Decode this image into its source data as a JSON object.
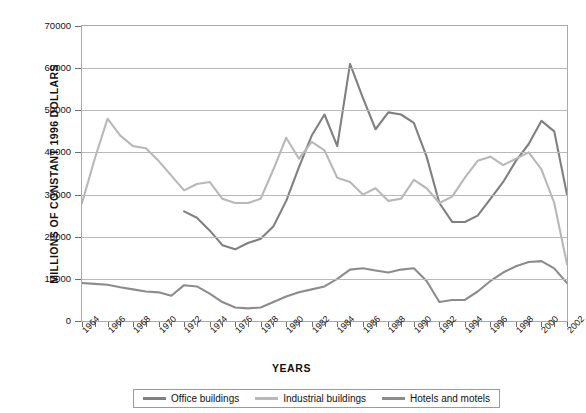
{
  "chart_data": {
    "type": "line",
    "title": "",
    "xlabel": "YEARS",
    "ylabel": "MILLIONS OF CONSTANT 1996 DOLLARS",
    "xlim": [
      1964,
      2002
    ],
    "ylim": [
      0,
      70000
    ],
    "grid": true,
    "legend_position": "bottom",
    "x_tick_labels": [
      "1964",
      "1966",
      "1968",
      "1970",
      "1972",
      "1974",
      "1976",
      "1978",
      "1980",
      "1982",
      "1984",
      "1986",
      "1988",
      "1990",
      "1992",
      "1994",
      "1996",
      "1998",
      "2000",
      "2002"
    ],
    "y_tick_labels": [
      "0",
      "10000",
      "20000",
      "30000",
      "40000",
      "50000",
      "60000",
      "70000"
    ],
    "y_ticks": [
      0,
      10000,
      20000,
      30000,
      40000,
      50000,
      60000,
      70000
    ],
    "x": [
      1964,
      1965,
      1966,
      1967,
      1968,
      1969,
      1970,
      1971,
      1972,
      1973,
      1974,
      1975,
      1976,
      1977,
      1978,
      1979,
      1980,
      1981,
      1982,
      1983,
      1984,
      1985,
      1986,
      1987,
      1988,
      1989,
      1990,
      1991,
      1992,
      1993,
      1994,
      1995,
      1996,
      1997,
      1998,
      1999,
      2000,
      2001,
      2002
    ],
    "series": [
      {
        "name": "Office buildings",
        "color": "#808080",
        "values": [
          null,
          null,
          null,
          null,
          null,
          null,
          null,
          null,
          26000,
          24500,
          21500,
          18000,
          17000,
          18500,
          19500,
          22500,
          28500,
          36500,
          44000,
          49000,
          41500,
          61000,
          53000,
          45500,
          49500,
          49000,
          47000,
          39000,
          28000,
          23500,
          23500,
          25000,
          29000,
          33000,
          38000,
          42000,
          47500,
          45000,
          30000
        ]
      },
      {
        "name": "Industrial buildings",
        "color": "#b8b8b8",
        "values": [
          28000,
          38500,
          48000,
          44000,
          41500,
          41000,
          38000,
          34500,
          31000,
          32500,
          33000,
          29000,
          28000,
          28000,
          29000,
          36000,
          43500,
          38500,
          42500,
          40500,
          34000,
          33000,
          30000,
          31500,
          28500,
          29000,
          33500,
          31500,
          28000,
          29500,
          34000,
          38000,
          39000,
          37000,
          38500,
          40000,
          36000,
          28000,
          13500
        ]
      },
      {
        "name": "Hotels and motels",
        "color": "#8c8c8c",
        "values": [
          9000,
          8800,
          8600,
          8000,
          7500,
          7000,
          6800,
          6000,
          8500,
          8200,
          6500,
          4500,
          3200,
          3000,
          3200,
          4500,
          5800,
          6800,
          7500,
          8200,
          10000,
          12200,
          12500,
          12000,
          11500,
          12200,
          12500,
          9500,
          4500,
          5000,
          5000,
          7000,
          9500,
          11500,
          13000,
          14000,
          14200,
          12500,
          9000
        ]
      }
    ]
  },
  "legend": {
    "items": [
      {
        "label": "Office buildings",
        "color": "#808080"
      },
      {
        "label": "Industrial buildings",
        "color": "#b8b8b8"
      },
      {
        "label": "Hotels and motels",
        "color": "#8c8c8c"
      }
    ]
  }
}
